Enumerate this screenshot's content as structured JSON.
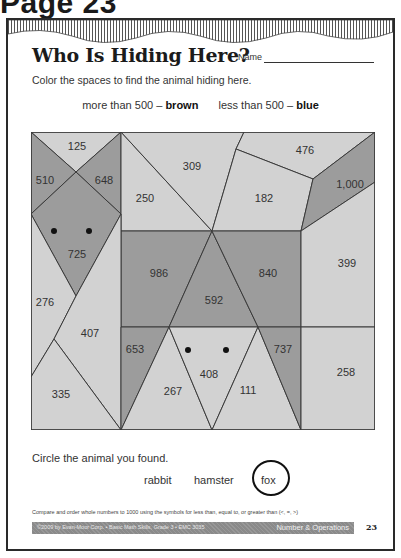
{
  "page_heading": "Page 23",
  "worksheet": {
    "title": "Who Is Hiding Here?",
    "name_label": "Name",
    "instructions": "Color the spaces to find the animal hiding here.",
    "legend": {
      "more_prefix": "more than 500 –",
      "more_color": "brown",
      "less_prefix": "less than 500 –",
      "less_color": "blue"
    },
    "colors": {
      "brown_fill": "#9c9c9c",
      "blue_fill": "#d2d2d2",
      "outline": "#3a3a3a",
      "eye": "#111111"
    },
    "regions": [
      {
        "id": "r125",
        "value": "125",
        "color": "blue"
      },
      {
        "id": "r510",
        "value": "510",
        "color": "brown"
      },
      {
        "id": "r648",
        "value": "648",
        "color": "brown"
      },
      {
        "id": "r250",
        "value": "250",
        "color": "blue"
      },
      {
        "id": "r309",
        "value": "309",
        "color": "blue"
      },
      {
        "id": "r476",
        "value": "476",
        "color": "blue"
      },
      {
        "id": "r182",
        "value": "182",
        "color": "blue"
      },
      {
        "id": "r1000",
        "value": "1,000",
        "color": "brown"
      },
      {
        "id": "r725",
        "value": "725",
        "color": "brown"
      },
      {
        "id": "r986",
        "value": "986",
        "color": "brown"
      },
      {
        "id": "r840",
        "value": "840",
        "color": "brown"
      },
      {
        "id": "r399",
        "value": "399",
        "color": "blue"
      },
      {
        "id": "r276",
        "value": "276",
        "color": "blue"
      },
      {
        "id": "r592",
        "value": "592",
        "color": "brown"
      },
      {
        "id": "r407",
        "value": "407",
        "color": "blue"
      },
      {
        "id": "r653",
        "value": "653",
        "color": "brown"
      },
      {
        "id": "r737",
        "value": "737",
        "color": "brown"
      },
      {
        "id": "r408",
        "value": "408",
        "color": "blue"
      },
      {
        "id": "r335",
        "value": "335",
        "color": "blue"
      },
      {
        "id": "r267",
        "value": "267",
        "color": "blue"
      },
      {
        "id": "r111",
        "value": "111",
        "color": "blue"
      },
      {
        "id": "r258",
        "value": "258",
        "color": "blue"
      }
    ],
    "circle_prompt": "Circle the animal you found.",
    "choices": [
      "rabbit",
      "hamster",
      "fox"
    ],
    "circled_choice": "fox",
    "standard": "Compare and order whole numbers to 1000 using the symbols for less than, equal to, or greater than (<, =, >)",
    "footer": {
      "copyright": "©2009 by Evan-Moor Corp. • Basic Math Skills, Grade 3 • EMC 3035",
      "section": "Number & Operations",
      "page_number": "23"
    }
  }
}
